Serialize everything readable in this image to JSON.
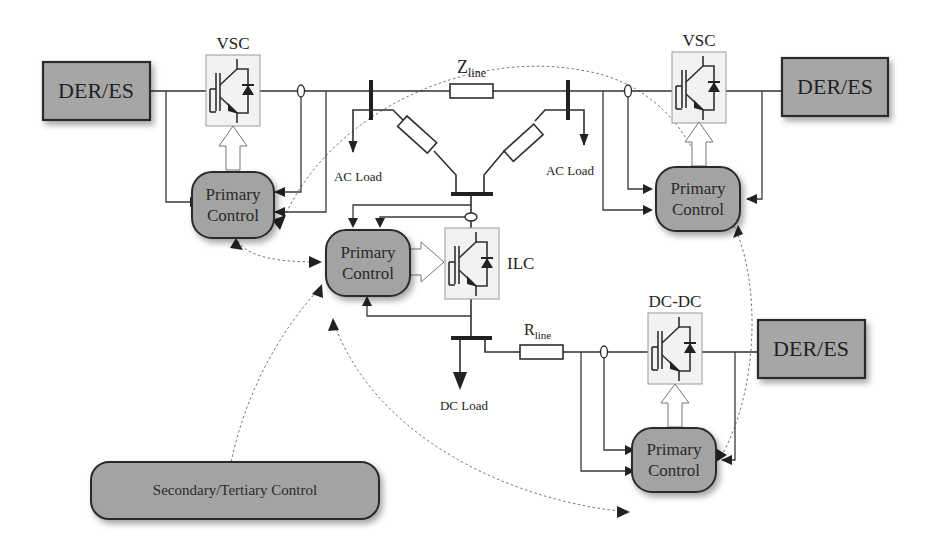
{
  "diagram": {
    "title": "",
    "der_blocks": [
      {
        "id": "der-left",
        "label": "DER/ES"
      },
      {
        "id": "der-right",
        "label": "DER/ES"
      },
      {
        "id": "der-dc",
        "label": "DER/ES"
      }
    ],
    "converters": [
      {
        "id": "vsc-left",
        "label": "VSC"
      },
      {
        "id": "vsc-right",
        "label": "VSC"
      },
      {
        "id": "ilc",
        "label": "ILC"
      },
      {
        "id": "dcdc",
        "label": "DC-DC"
      }
    ],
    "primary_controls": [
      {
        "id": "pc-left",
        "line1": "Primary",
        "line2": "Control"
      },
      {
        "id": "pc-right",
        "line1": "Primary",
        "line2": "Control"
      },
      {
        "id": "pc-center",
        "line1": "Primary",
        "line2": "Control"
      },
      {
        "id": "pc-dc",
        "line1": "Primary",
        "line2": "Control"
      }
    ],
    "secondary_control": {
      "label": "Secondary/Tertiary Control"
    },
    "impedances": {
      "zline": {
        "main": "Z",
        "sub": "line"
      },
      "rline": {
        "main": "R",
        "sub": "line"
      }
    },
    "loads": [
      {
        "id": "ac-load-left",
        "label": "AC Load"
      },
      {
        "id": "ac-load-right",
        "label": "AC Load"
      },
      {
        "id": "dc-load",
        "label": "DC Load"
      }
    ],
    "colors": {
      "block_fill": "#a6a6a6",
      "converter_fill": "#f2f2f2",
      "line": "#2f2f2f",
      "comm_link": "#777777"
    }
  }
}
